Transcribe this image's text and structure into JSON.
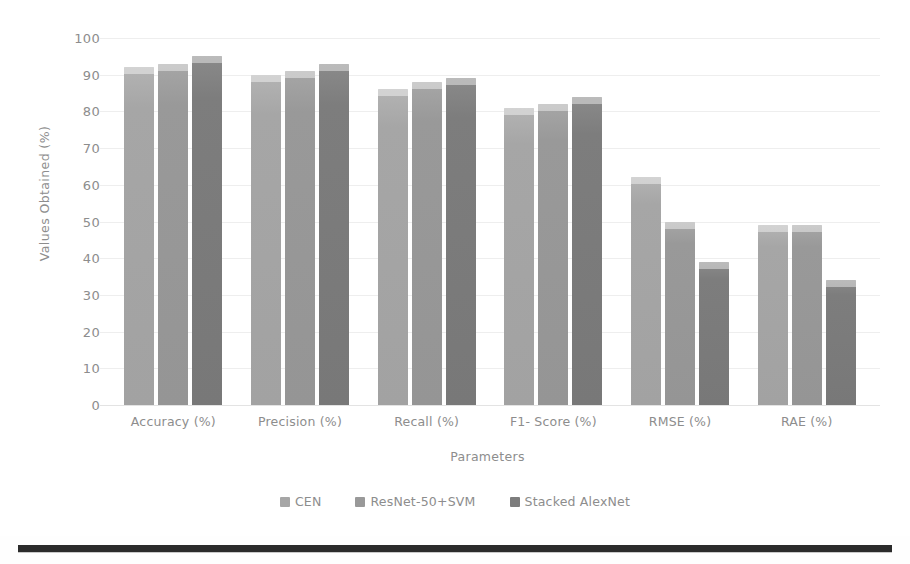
{
  "chart_data": {
    "type": "bar",
    "title": "",
    "xlabel": "Parameters",
    "ylabel": "Values Obtained  (%)",
    "categories": [
      "Accuracy (%)",
      "Precision (%)",
      "Recall (%)",
      "F1- Score (%)",
      "RMSE (%)",
      "RAE (%)"
    ],
    "series": [
      {
        "name": "CEN",
        "color": "#a6a6a6",
        "values": [
          92,
          90,
          86,
          81,
          62,
          49
        ]
      },
      {
        "name": "ResNet-50+SVM",
        "color": "#999999",
        "values": [
          93,
          91,
          88,
          82,
          50,
          49
        ]
      },
      {
        "name": "Stacked AlexNet",
        "color": "#7d7d7d",
        "values": [
          95,
          93,
          89,
          84,
          39,
          34
        ]
      }
    ],
    "ylim": [
      0,
      100
    ],
    "yticks": [
      100,
      90,
      80,
      70,
      60,
      50,
      40,
      30,
      20,
      10,
      0
    ],
    "grid": true,
    "legend_position": "bottom"
  },
  "legend": {
    "items": [
      {
        "label": "CEN",
        "color": "#a6a6a6"
      },
      {
        "label": "ResNet-50+SVM",
        "color": "#999999"
      },
      {
        "label": "Stacked AlexNet",
        "color": "#7d7d7d"
      }
    ]
  }
}
